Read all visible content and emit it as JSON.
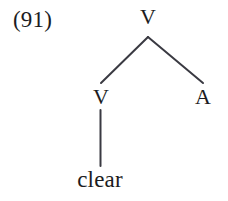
{
  "figure": {
    "example_number": "(91)",
    "background_color": "#ffffff",
    "ink_color": "#1c1c22",
    "branch_color": "#3a3a42",
    "width": 228,
    "height": 201
  },
  "tree": {
    "root": {
      "label": "V",
      "x": 148,
      "y": 17
    },
    "children": [
      {
        "label": "V",
        "x": 101,
        "y": 97,
        "terminal": {
          "label": "clear",
          "x": 100,
          "y": 179
        }
      },
      {
        "label": "A",
        "x": 203,
        "y": 97
      }
    ],
    "edges": [
      {
        "name": "root-to-left-v",
        "x1": 148,
        "y1": 37,
        "x2": 101,
        "y2": 83
      },
      {
        "name": "root-to-right-a",
        "x1": 148,
        "y1": 37,
        "x2": 203,
        "y2": 83
      },
      {
        "name": "left-v-to-clear",
        "x1": 100.5,
        "y1": 110,
        "x2": 100.5,
        "y2": 166
      }
    ]
  }
}
